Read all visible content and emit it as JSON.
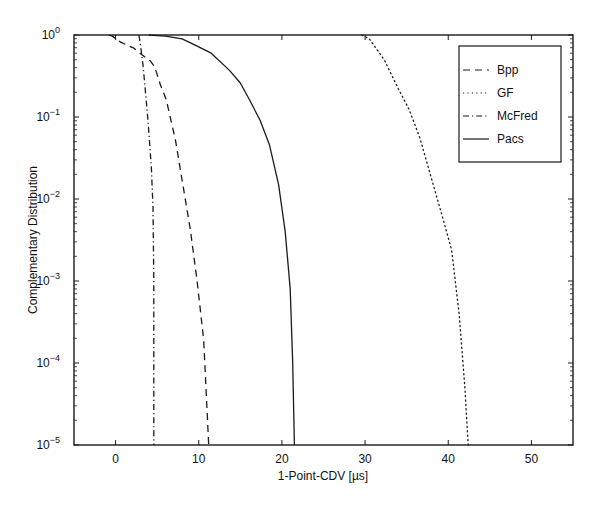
{
  "chart_data": {
    "type": "line",
    "title": "",
    "xlabel": "1-Point-CDV [µs]",
    "ylabel": "Complementary Distribution",
    "xlim": [
      -5,
      55
    ],
    "ylim": [
      1e-05,
      1
    ],
    "yscale": "log",
    "grid": false,
    "legend_position": "upper right",
    "x_ticks": [
      0,
      10,
      20,
      30,
      40,
      50
    ],
    "x_tick_labels": [
      "0",
      "10",
      "20",
      "30",
      "40",
      "50"
    ],
    "y_ticks_exp": [
      0,
      -1,
      -2,
      -3,
      -4,
      -5
    ],
    "y_tick_labels": [
      "10^0",
      "10^-1",
      "10^-2",
      "10^-3",
      "10^-4",
      "10^-5"
    ],
    "series": [
      {
        "name": "Bpp",
        "style": "dashed",
        "x": [
          -0.8,
          -0.4,
          0.6,
          2.2,
          3.0,
          4.2,
          4.7,
          5.4,
          6.1,
          7.2,
          8.0,
          9.0,
          9.8,
          10.6,
          11.2
        ],
        "y": [
          1.0,
          0.97,
          0.82,
          0.69,
          0.59,
          0.48,
          0.41,
          0.245,
          0.162,
          0.052,
          0.017,
          0.0042,
          0.001,
          0.00019,
          1e-05
        ]
      },
      {
        "name": "GF",
        "style": "dotted",
        "x": [
          29.6,
          30.5,
          32.3,
          34.0,
          35.3,
          36.6,
          37.7,
          39.0,
          40.4,
          41.3,
          42.0,
          42.4
        ],
        "y": [
          1.0,
          0.9,
          0.5,
          0.22,
          0.123,
          0.055,
          0.0224,
          0.0078,
          0.0024,
          0.0004,
          5e-05,
          1e-05
        ]
      },
      {
        "name": "McFred",
        "style": "dashdot",
        "x": [
          2.8,
          3.0,
          3.3,
          3.6,
          3.9,
          4.3,
          4.5,
          4.6,
          4.6,
          4.6
        ],
        "y": [
          1.0,
          0.75,
          0.43,
          0.2,
          0.09,
          0.025,
          0.008,
          0.001,
          0.0001,
          1e-05
        ]
      },
      {
        "name": "Pacs",
        "style": "solid",
        "x": [
          4.0,
          6.0,
          8.0,
          9.5,
          11.5,
          13.7,
          15.0,
          16.1,
          17.4,
          18.5,
          19.6,
          20.4,
          21.0,
          21.3,
          21.5
        ],
        "y": [
          1.0,
          0.97,
          0.9,
          0.76,
          0.6,
          0.37,
          0.26,
          0.162,
          0.09,
          0.046,
          0.015,
          0.004,
          0.0008,
          0.0001,
          1e-05
        ]
      }
    ]
  },
  "legend": {
    "items": [
      {
        "label": "Bpp",
        "style": "dashed"
      },
      {
        "label": "GF",
        "style": "dotted"
      },
      {
        "label": "McFred",
        "style": "dashdot"
      },
      {
        "label": "Pacs",
        "style": "solid"
      }
    ]
  },
  "colors": {
    "line": "#1a1a1a",
    "axis": "#1a1a1a",
    "background": "#ffffff"
  }
}
